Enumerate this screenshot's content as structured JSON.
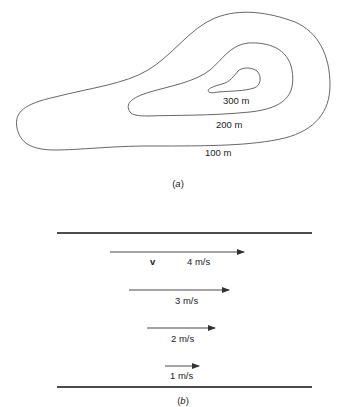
{
  "part_a": {
    "caption_open": "(",
    "caption_letter": "a",
    "caption_close": ")",
    "contours": [
      {
        "elevation": "100 m"
      },
      {
        "elevation": "200 m"
      },
      {
        "elevation": "300 m"
      }
    ]
  },
  "part_b": {
    "caption_open": "(",
    "caption_letter": "b",
    "caption_close": ")",
    "vector_symbol": "v",
    "velocities": [
      {
        "label": "4 m/s",
        "value": 4
      },
      {
        "label": "3 m/s",
        "value": 3
      },
      {
        "label": "2 m/s",
        "value": 2
      },
      {
        "label": "1 m/s",
        "value": 1
      }
    ]
  }
}
